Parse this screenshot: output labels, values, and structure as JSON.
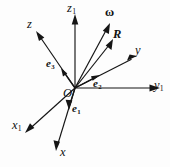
{
  "figure": {
    "kind": "vector-coordinate-diagram",
    "background_color": "#fdfdfd",
    "ink_color": "#151515",
    "width": 170,
    "height": 167,
    "origin": {
      "x": 75,
      "y": 88,
      "label": "O"
    }
  },
  "labels": {
    "origin": "O",
    "z_rot": "z",
    "z_fix_base": "z",
    "z_fix_sub": "1",
    "x_rot": "x",
    "x_fix_base": "x",
    "x_fix_sub": "1",
    "y_rot": "y",
    "y_fix_base": "y",
    "y_fix_sub": "1",
    "e1_base": "e",
    "e1_sub": "1",
    "e2_base": "e",
    "e2_sub": "2",
    "e3_base": "e",
    "e3_sub": "3",
    "omega": "ω",
    "radius_vector": "R"
  },
  "vectors": [
    {
      "name": "z-axis-rotating",
      "label": "z",
      "from": {
        "x": 75,
        "y": 88
      },
      "to": {
        "x": 36,
        "y": 31
      },
      "style": "axis",
      "label_pos": {
        "x": 29,
        "y": 20
      }
    },
    {
      "name": "z1-axis-fixed",
      "label": "z1",
      "from": {
        "x": 75,
        "y": 88
      },
      "to": {
        "x": 75,
        "y": 14
      },
      "style": "axis",
      "label_pos": {
        "x": 69,
        "y": 2
      }
    },
    {
      "name": "omega-vector",
      "label": "ω",
      "from": {
        "x": 75,
        "y": 88
      },
      "to": {
        "x": 110,
        "y": 23
      },
      "style": "vector",
      "label_pos": {
        "x": 106,
        "y": 7
      }
    },
    {
      "name": "R-vector",
      "label": "R",
      "from": {
        "x": 75,
        "y": 88
      },
      "to": {
        "x": 113,
        "y": 39
      },
      "style": "vector",
      "label_pos": {
        "x": 113,
        "y": 30
      }
    },
    {
      "name": "y-axis-rotating",
      "label": "y",
      "from": {
        "x": 75,
        "y": 88
      },
      "to": {
        "x": 137,
        "y": 56
      },
      "style": "axis",
      "label_pos": {
        "x": 136,
        "y": 46
      }
    },
    {
      "name": "y1-axis-fixed",
      "label": "y1",
      "from": {
        "x": 75,
        "y": 88
      },
      "to": {
        "x": 160,
        "y": 88
      },
      "style": "axis",
      "label_pos": {
        "x": 155,
        "y": 81
      }
    },
    {
      "name": "x-axis-rotating",
      "label": "x",
      "from": {
        "x": 75,
        "y": 88
      },
      "to": {
        "x": 56,
        "y": 151
      },
      "style": "axis",
      "label_pos": {
        "x": 60,
        "y": 147
      }
    },
    {
      "name": "x1-axis-fixed",
      "label": "x1",
      "from": {
        "x": 75,
        "y": 88
      },
      "to": {
        "x": 25,
        "y": 133
      },
      "style": "axis",
      "label_pos": {
        "x": 13,
        "y": 121
      }
    },
    {
      "name": "e3-unit-vector",
      "label": "e3",
      "from": {
        "x": 75,
        "y": 88
      },
      "to": {
        "x": 61,
        "y": 68
      },
      "style": "unit",
      "label_pos": {
        "x": 48,
        "y": 60
      }
    },
    {
      "name": "e2-unit-vector",
      "label": "e2",
      "from": {
        "x": 75,
        "y": 88
      },
      "to": {
        "x": 100,
        "y": 75
      },
      "style": "unit",
      "label_pos": {
        "x": 94,
        "y": 79
      }
    },
    {
      "name": "e1-unit-vector",
      "label": "e1",
      "from": {
        "x": 75,
        "y": 88
      },
      "to": {
        "x": 69,
        "y": 110
      },
      "style": "unit",
      "label_pos": {
        "x": 72,
        "y": 104
      }
    }
  ]
}
